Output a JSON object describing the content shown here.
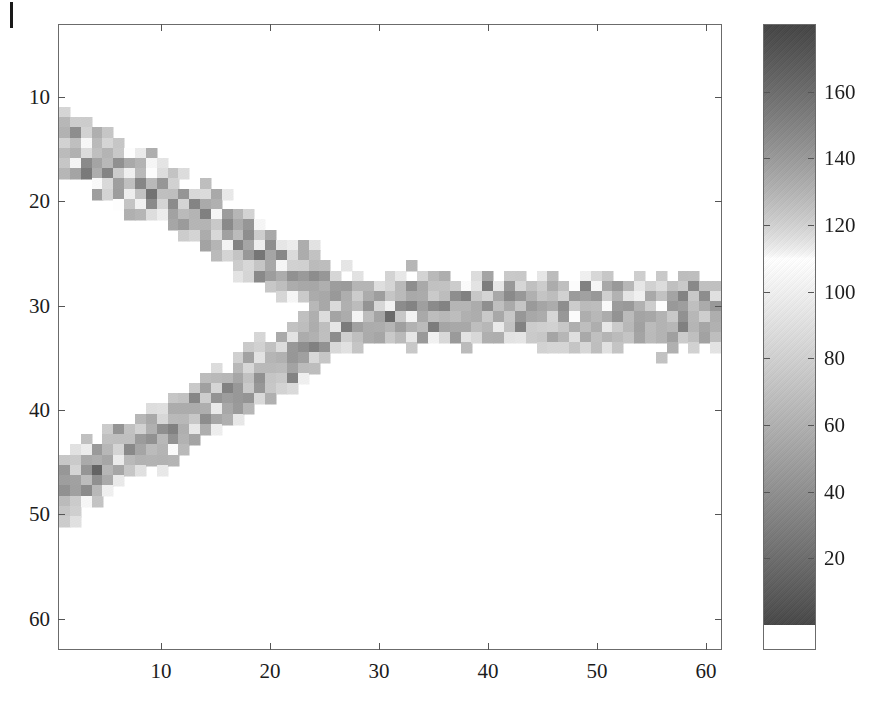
{
  "figure": {
    "kind": "grayscale-image-heatmap-with-colorbar",
    "title": "",
    "xlabel": "",
    "ylabel": ""
  },
  "axes": {
    "x_ticks": [
      "10",
      "20",
      "30",
      "40",
      "50",
      "60"
    ],
    "x_tick_values": [
      10,
      20,
      30,
      40,
      50,
      60
    ],
    "y_ticks": [
      "10",
      "20",
      "30",
      "40",
      "50",
      "60"
    ],
    "y_tick_values": [
      10,
      20,
      30,
      40,
      50,
      60
    ],
    "xlim": [
      0.5,
      61.5
    ],
    "ylim_top": 3.0,
    "ylim_bottom": 63.0
  },
  "colorbar": {
    "ticks": [
      "20",
      "40",
      "60",
      "80",
      "100",
      "120",
      "140",
      "160"
    ],
    "tick_values": [
      20,
      40,
      60,
      80,
      100,
      120,
      140,
      160
    ],
    "range": [
      0,
      180
    ],
    "peak_brightness_value": 110,
    "dark_hex": "#4a4a4a",
    "light_hex": "#fdfdfd",
    "description": "non-monotonic gray ramp: dark at low values, brightest near 110, dark again at high values"
  },
  "chart_data": {
    "type": "heatmap",
    "title": "",
    "xlabel": "",
    "ylabel": "",
    "colormap": "gray-nonmonotonic",
    "nx": 61,
    "ny": 61,
    "x_range": [
      1,
      61
    ],
    "y_range": [
      3,
      63
    ],
    "xlim": [
      0.5,
      61.5
    ],
    "ylim": [
      63,
      3
    ],
    "zlim": [
      0,
      180
    ],
    "grid": false,
    "legend": "colorbar-right",
    "background_value": null,
    "structure": {
      "shape": "Y / chevron shaped band opening to the left",
      "upper_branch": {
        "start_xy": [
          1,
          14
        ],
        "join_xy": [
          28,
          30
        ],
        "half_width": 3.2
      },
      "lower_branch": {
        "start_xy": [
          1,
          48
        ],
        "join_xy": [
          28,
          31
        ],
        "half_width": 3.2
      },
      "trunk": {
        "start_xy": [
          28,
          30.5
        ],
        "end_xy": [
          61,
          30.5
        ],
        "half_width": 3.6
      }
    },
    "value_stats": {
      "band_mean": 52,
      "band_noise_sigma": 34,
      "bright_speckle_fraction": 0.16,
      "bright_speckle_value_range": [
        95,
        135
      ]
    }
  }
}
